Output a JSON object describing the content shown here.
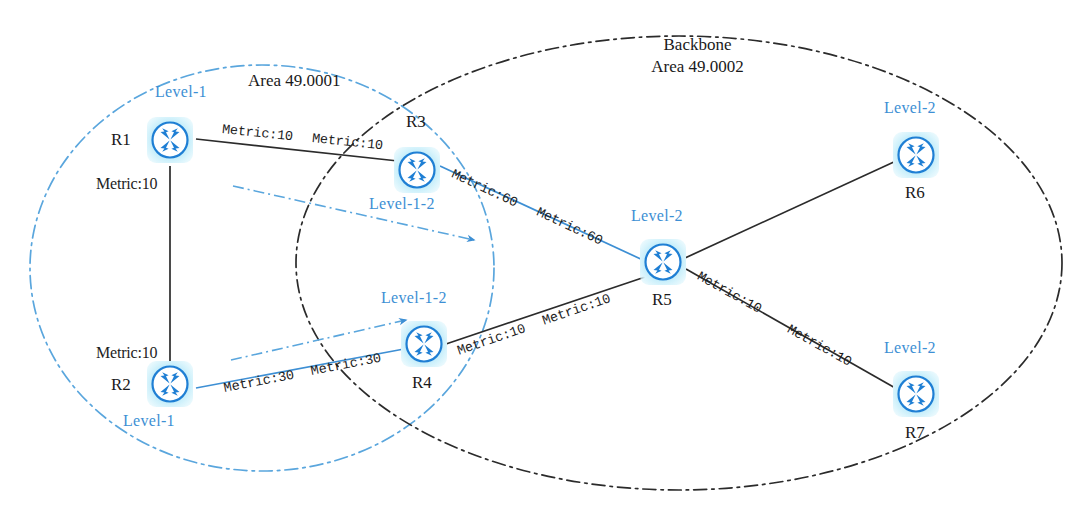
{
  "diagram": {
    "colors": {
      "area_circle": "#4a9fd8",
      "backbone_ellipse": "#2b2b2b",
      "level_text": "#3d8fd4",
      "blue_link": "#3d8fd4",
      "black_link": "#2b2b2b",
      "node_ring": "#1f7fd4",
      "node_glow": "#b7e9f9"
    },
    "areas": [
      {
        "id": "area-49-0001",
        "name": "Area 49.0001",
        "style": "blue dash-dot circle",
        "label_x": 248,
        "label_y": 80
      },
      {
        "id": "backbone-49-0002",
        "name": "Backbone",
        "name_line2": "Area 49.0002",
        "style": "black dash-dot ellipse",
        "label_x": 697,
        "label_y": 40
      }
    ],
    "routers": [
      {
        "id": "R1",
        "name": "R1",
        "level": "Level-1",
        "x": 170,
        "y": 140,
        "name_pos": "left",
        "level_pos": "above"
      },
      {
        "id": "R2",
        "name": "R2",
        "level": "Level-1",
        "x": 170,
        "y": 384,
        "name_pos": "left",
        "level_pos": "below"
      },
      {
        "id": "R3",
        "name": "R3",
        "level": "Level-1-2",
        "x": 417,
        "y": 170,
        "name_pos": "above",
        "level_pos": "below"
      },
      {
        "id": "R4",
        "name": "R4",
        "level": "Level-1-2",
        "x": 424,
        "y": 344,
        "name_pos": "below",
        "level_pos": "above"
      },
      {
        "id": "R5",
        "name": "R5",
        "level": "Level-2",
        "x": 663,
        "y": 262,
        "name_pos": "below",
        "level_pos": "above"
      },
      {
        "id": "R6",
        "name": "R6",
        "level": "Level-2",
        "x": 916,
        "y": 155,
        "name_pos": "below",
        "level_pos": "above"
      },
      {
        "id": "R7",
        "name": "R7",
        "level": "Level-2",
        "x": 916,
        "y": 394,
        "name_pos": "below",
        "level_pos": "above"
      }
    ],
    "links": [
      {
        "id": "r1-r3",
        "from": "R1",
        "to": "R3",
        "color": "black",
        "labels": [
          "Metric:10",
          "Metric:10"
        ]
      },
      {
        "id": "r1-r2",
        "from": "R1",
        "to": "R2",
        "color": "black",
        "labels": [
          "Metric:10",
          "Metric:10"
        ]
      },
      {
        "id": "r2-r4",
        "from": "R2",
        "to": "R4",
        "color": "blue",
        "labels": [
          "Metric:30",
          "Metric:30"
        ]
      },
      {
        "id": "r3-r5",
        "from": "R3",
        "to": "R5",
        "color": "blue",
        "labels": [
          "Metric:60",
          "Metric:60"
        ]
      },
      {
        "id": "r4-r5",
        "from": "R4",
        "to": "R5",
        "color": "black",
        "labels": [
          "Metric:10",
          "Metric:10"
        ]
      },
      {
        "id": "r5-r6",
        "from": "R5",
        "to": "R6",
        "color": "black",
        "labels": []
      },
      {
        "id": "r5-r7",
        "from": "R5",
        "to": "R7",
        "color": "black",
        "labels": [
          "Metric:10",
          "Metric:10"
        ]
      }
    ],
    "metric_labels": [
      {
        "id": "m-r1r3-a",
        "text": "Metric:10",
        "x": 222,
        "y": 137,
        "rot": 6
      },
      {
        "id": "m-r1r3-b",
        "text": "Metric:10",
        "x": 312,
        "y": 146,
        "rot": 6
      },
      {
        "id": "m-r1r2-a",
        "text": "Metric:10",
        "x": 96,
        "y": 183,
        "rot": 0
      },
      {
        "id": "m-r1r2-b",
        "text": "Metric:10",
        "x": 96,
        "y": 352,
        "rot": 0
      },
      {
        "id": "m-r2r4-a",
        "text": "Metric:30",
        "x": 224,
        "y": 396,
        "rot": -16
      },
      {
        "id": "m-r2r4-b",
        "text": "Metric:30",
        "x": 311,
        "y": 371,
        "rot": -16
      },
      {
        "id": "m-r3r5-a",
        "text": "Metric:60",
        "x": 455,
        "y": 178,
        "rot": 22
      },
      {
        "id": "m-r3r5-b",
        "text": "Metric:60",
        "x": 540,
        "y": 212,
        "rot": 22
      },
      {
        "id": "m-r4r5-a",
        "text": "Metric:10",
        "x": 460,
        "y": 352,
        "rot": -17
      },
      {
        "id": "m-r4r5-b",
        "text": "Metric:10",
        "x": 546,
        "y": 326,
        "rot": -17
      },
      {
        "id": "m-r5r7-a",
        "text": "Metric:10",
        "x": 700,
        "y": 277,
        "rot": 29
      },
      {
        "id": "m-r5r7-b",
        "text": "Metric:10",
        "x": 790,
        "y": 331,
        "rot": 29
      }
    ],
    "annotation_arrows": [
      {
        "id": "leak-arrow-upper",
        "from_x": 233,
        "from_y": 186,
        "to_x": 479,
        "to_y": 241,
        "color": "#4a9fd8",
        "style": "dash-dot with arrowhead"
      },
      {
        "id": "leak-arrow-lower",
        "from_x": 231,
        "from_y": 360,
        "to_x": 410,
        "to_y": 319,
        "color": "#4a9fd8",
        "style": "dash-dot with arrowhead"
      }
    ]
  }
}
